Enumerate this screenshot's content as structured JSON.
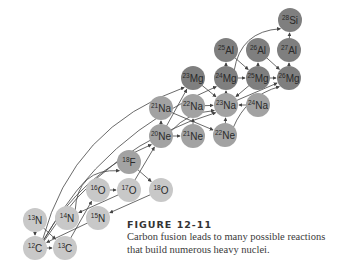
{
  "figure": {
    "title": "FIGURE 12-11",
    "caption_line1": "Carbon fusion leads to many possible reactions",
    "caption_line2": "that build numerous heavy nuclei."
  },
  "colors": {
    "light_nucleus": "#c8c8c8",
    "medium_nucleus": "#a2a2a2",
    "dark_nucleus": "#7f7f7f",
    "arrow": "#444444"
  },
  "nuclei": [
    {
      "id": "C12",
      "mass": "12",
      "symbol": "C",
      "x": 35,
      "y": 248,
      "shade": "light"
    },
    {
      "id": "C13",
      "mass": "13",
      "symbol": "C",
      "x": 65,
      "y": 248,
      "shade": "light"
    },
    {
      "id": "N13",
      "mass": "13",
      "symbol": "N",
      "x": 35,
      "y": 220,
      "shade": "light"
    },
    {
      "id": "N14",
      "mass": "14",
      "symbol": "N",
      "x": 67,
      "y": 218,
      "shade": "light"
    },
    {
      "id": "N15",
      "mass": "15",
      "symbol": "N",
      "x": 98,
      "y": 218,
      "shade": "light"
    },
    {
      "id": "O16",
      "mass": "16",
      "symbol": "O",
      "x": 98,
      "y": 190,
      "shade": "light"
    },
    {
      "id": "O17",
      "mass": "17",
      "symbol": "O",
      "x": 129,
      "y": 190,
      "shade": "light"
    },
    {
      "id": "O18",
      "mass": "18",
      "symbol": "O",
      "x": 161,
      "y": 190,
      "shade": "light"
    },
    {
      "id": "F18",
      "mass": "18",
      "symbol": "F",
      "x": 129,
      "y": 162,
      "shade": "medium"
    },
    {
      "id": "Ne20",
      "mass": "20",
      "symbol": "Ne",
      "x": 161,
      "y": 136,
      "shade": "medium"
    },
    {
      "id": "Ne21",
      "mass": "21",
      "symbol": "Ne",
      "x": 193,
      "y": 136,
      "shade": "medium"
    },
    {
      "id": "Ne22",
      "mass": "22",
      "symbol": "Ne",
      "x": 225,
      "y": 135,
      "shade": "medium"
    },
    {
      "id": "Na21",
      "mass": "21",
      "symbol": "Na",
      "x": 161,
      "y": 108,
      "shade": "medium"
    },
    {
      "id": "Na22",
      "mass": "22",
      "symbol": "Na",
      "x": 193,
      "y": 106,
      "shade": "medium"
    },
    {
      "id": "Na23",
      "mass": "23",
      "symbol": "Na",
      "x": 226,
      "y": 105,
      "shade": "medium"
    },
    {
      "id": "Na24",
      "mass": "24",
      "symbol": "Na",
      "x": 258,
      "y": 105,
      "shade": "medium"
    },
    {
      "id": "Mg23",
      "mass": "23",
      "symbol": "Mg",
      "x": 193,
      "y": 78,
      "shade": "dark"
    },
    {
      "id": "Mg24",
      "mass": "24",
      "symbol": "Mg",
      "x": 226,
      "y": 78,
      "shade": "dark"
    },
    {
      "id": "Mg25",
      "mass": "25",
      "symbol": "Mg",
      "x": 258,
      "y": 78,
      "shade": "dark"
    },
    {
      "id": "Mg26",
      "mass": "26",
      "symbol": "Mg",
      "x": 289,
      "y": 78,
      "shade": "dark"
    },
    {
      "id": "Al25",
      "mass": "25",
      "symbol": "Al",
      "x": 226,
      "y": 50,
      "shade": "dark"
    },
    {
      "id": "Al26",
      "mass": "26",
      "symbol": "Al",
      "x": 258,
      "y": 50,
      "shade": "dark"
    },
    {
      "id": "Al27",
      "mass": "27",
      "symbol": "Al",
      "x": 289,
      "y": 50,
      "shade": "dark"
    },
    {
      "id": "Si28",
      "mass": "28",
      "symbol": "Si",
      "x": 290,
      "y": 20,
      "shade": "dark"
    }
  ],
  "reactions": [
    {
      "from": "C12",
      "to": "C13",
      "curve": 0
    },
    {
      "from": "N13",
      "to": "C12",
      "curve": 0
    },
    {
      "from": "N13",
      "to": "C13",
      "curve": 0
    },
    {
      "from": "C13",
      "to": "O16",
      "curve": 0
    },
    {
      "from": "N15",
      "to": "C12",
      "curve": 0
    },
    {
      "from": "O16",
      "to": "O17",
      "curve": 0
    },
    {
      "from": "O17",
      "to": "N14",
      "curve": 0
    },
    {
      "from": "O18",
      "to": "N15",
      "curve": 0
    },
    {
      "from": "N14",
      "to": "F18",
      "curve": -30
    },
    {
      "from": "F18",
      "to": "O18",
      "curve": 0
    },
    {
      "from": "O17",
      "to": "Ne20",
      "curve": 0
    },
    {
      "from": "C12",
      "to": "Ne20",
      "curve": -25
    },
    {
      "from": "C12",
      "to": "Na23",
      "curve": -40
    },
    {
      "from": "C12",
      "to": "Mg23",
      "curve": -55
    },
    {
      "from": "C12",
      "to": "Mg24",
      "curve": -40
    },
    {
      "from": "Ne20",
      "to": "Ne21",
      "curve": 0
    },
    {
      "from": "Ne20",
      "to": "Na21",
      "curve": 0
    },
    {
      "from": "Ne21",
      "to": "Na22",
      "curve": 0
    },
    {
      "from": "Na21",
      "to": "Ne22",
      "curve": 0
    },
    {
      "from": "Ne20",
      "to": "Na23",
      "curve": -10
    },
    {
      "from": "Ne22",
      "to": "Na23",
      "curve": 0
    },
    {
      "from": "Ne22",
      "to": "Mg26",
      "curve": -15
    },
    {
      "from": "Na22",
      "to": "Na23",
      "curve": 0
    },
    {
      "from": "Mg23",
      "to": "Na23",
      "curve": 0
    },
    {
      "from": "Na23",
      "to": "Mg24",
      "curve": 0
    },
    {
      "from": "Na24",
      "to": "Na23",
      "curve": 0
    },
    {
      "from": "Mg24",
      "to": "Mg25",
      "curve": 0
    },
    {
      "from": "Mg25",
      "to": "Mg26",
      "curve": 0
    },
    {
      "from": "Mg24",
      "to": "Al25",
      "curve": 0
    },
    {
      "from": "Mg25",
      "to": "Al26",
      "curve": 0
    },
    {
      "from": "Al25",
      "to": "Mg25",
      "curve": 0
    },
    {
      "from": "Al26",
      "to": "Mg26",
      "curve": 0
    },
    {
      "from": "Mg26",
      "to": "Al27",
      "curve": 0
    },
    {
      "from": "Al27",
      "to": "Si28",
      "curve": 0
    },
    {
      "from": "Mg24",
      "to": "Si28",
      "curve": -25
    },
    {
      "from": "Mg25",
      "to": "Na23",
      "curve": 0
    },
    {
      "from": "Na23",
      "to": "Mg26",
      "curve": 0
    },
    {
      "from": "Ne20",
      "to": "Mg23",
      "curve": 0
    }
  ]
}
